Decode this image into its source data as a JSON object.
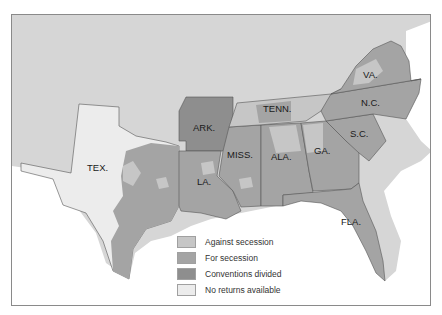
{
  "map": {
    "title": "Secession conventions, 1860-1861",
    "colors": {
      "background_land": "#d6d6d6",
      "water": "#ffffff",
      "against_secession": "#c6c6c6",
      "for_secession": "#a4a4a4",
      "conventions_divided": "#8e8e8e",
      "no_returns": "#ececec",
      "border": "#555555"
    },
    "states": [
      {
        "abbr": "VA.",
        "status": "mixed"
      },
      {
        "abbr": "N.C.",
        "status": "for_secession"
      },
      {
        "abbr": "TENN.",
        "status": "mixed"
      },
      {
        "abbr": "ARK.",
        "status": "conventions_divided"
      },
      {
        "abbr": "S.C.",
        "status": "for_secession"
      },
      {
        "abbr": "GA.",
        "status": "mixed"
      },
      {
        "abbr": "ALA.",
        "status": "mixed"
      },
      {
        "abbr": "MISS.",
        "status": "mixed"
      },
      {
        "abbr": "LA.",
        "status": "mixed"
      },
      {
        "abbr": "TEX.",
        "status": "mixed"
      },
      {
        "abbr": "FLA.",
        "status": "for_secession"
      }
    ]
  },
  "legend": {
    "items": [
      {
        "label": "Against secession",
        "color": "#c6c6c6"
      },
      {
        "label": "For secession",
        "color": "#a4a4a4"
      },
      {
        "label": "Conventions divided",
        "color": "#8e8e8e"
      },
      {
        "label": "No returns available",
        "color": "#ececec"
      }
    ]
  }
}
